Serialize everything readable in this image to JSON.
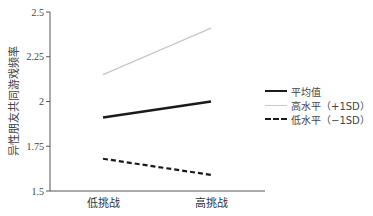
{
  "chart_data": {
    "type": "line",
    "title": "",
    "xlabel": "",
    "ylabel": "异性朋友共同游戏频率",
    "categories": [
      "低挑战",
      "高挑战"
    ],
    "ylim": [
      1.5,
      2.5
    ],
    "yticks": [
      "1.5",
      "1.75",
      "2",
      "2.25",
      "2.5"
    ],
    "grid": false,
    "legend_position": "right",
    "series": [
      {
        "name": "平均值",
        "values": [
          1.91,
          2.0
        ],
        "color": "#1a1a1a",
        "style": "solid-thick"
      },
      {
        "name": "高水平（+1SD）",
        "values": [
          2.15,
          2.41
        ],
        "color": "#c8c8c8",
        "style": "solid-thin"
      },
      {
        "name": "低水平（−1SD）",
        "values": [
          1.68,
          1.59
        ],
        "color": "#1a1a1a",
        "style": "dashed"
      }
    ]
  },
  "legend": {
    "items": [
      "平均值",
      "高水平（+1SD）",
      "低水平（−1SD）"
    ]
  }
}
